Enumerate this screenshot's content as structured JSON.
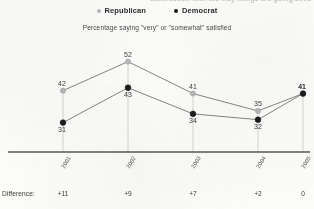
{
  "title_partial": "satisfaction with the way things are going  2001–2005",
  "legend": {
    "position": "top-center",
    "items": [
      {
        "label": "Republican",
        "color": "#b8b8b8",
        "marker": "legend-dot-republican"
      },
      {
        "label": "Democrat",
        "color": "#1c1c1c",
        "marker": "legend-dot-democrat"
      }
    ]
  },
  "subtitle": "Percentage saying \"very\" or \"somewhat\" satisfied",
  "difference_row": {
    "label": "Difference:",
    "values": [
      "+11",
      "+9",
      "+7",
      "+2",
      "0"
    ]
  },
  "chart_data": {
    "type": "line",
    "title": "Percentage saying \"very\" or \"somewhat\" satisfied",
    "xlabel": "",
    "ylabel": "",
    "categories": [
      "2001",
      "2002",
      "2003",
      "2004",
      "2005"
    ],
    "series": [
      {
        "name": "Republican",
        "color": "#b8b8b8",
        "values": [
          42,
          52,
          41,
          35,
          41
        ]
      },
      {
        "name": "Democrat",
        "color": "#1c1c1c",
        "values": [
          31,
          43,
          34,
          32,
          41
        ]
      }
    ],
    "ylim": [
      25,
      56
    ],
    "grid": false,
    "vertical_connectors": true,
    "data_labels": true,
    "legend_position": "top-center"
  }
}
